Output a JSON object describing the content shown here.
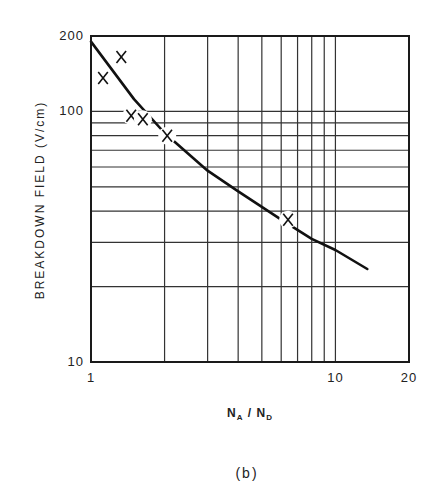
{
  "chart_data": {
    "type": "scatter",
    "title": "",
    "caption": "(b)",
    "xlabel": "N_A / N_D",
    "xlabel_parts": {
      "n1": "N",
      "s1": "A",
      "sep": " / ",
      "n2": "N",
      "s2": "D"
    },
    "ylabel": "BREAKDOWN FIELD (V/cm)",
    "xscale": "log",
    "yscale": "log",
    "xlim": [
      1,
      20
    ],
    "ylim": [
      10,
      200
    ],
    "x_tick_labels": [
      "1",
      "10",
      "20"
    ],
    "x_ticks": [
      1,
      10,
      20
    ],
    "y_tick_labels": [
      "10",
      "100",
      "200"
    ],
    "y_ticks": [
      10,
      100,
      200
    ],
    "grid": true,
    "x_gridlines": [
      2,
      3,
      4,
      5,
      6,
      7,
      8,
      9,
      10
    ],
    "y_gridlines": [
      20,
      30,
      40,
      50,
      60,
      70,
      80,
      90,
      100
    ],
    "series": [
      {
        "name": "measured",
        "marker": "x",
        "x": [
          1.12,
          1.33,
          1.46,
          1.63,
          2.05,
          6.4
        ],
        "y": [
          136,
          165,
          96,
          93,
          80,
          37
        ]
      },
      {
        "name": "fit curve",
        "style": "line",
        "x": [
          1.0,
          1.5,
          2.0,
          3.0,
          4.0,
          6.0,
          8.0,
          10.0,
          13.5
        ],
        "y": [
          190,
          112,
          82,
          58,
          48,
          37,
          31,
          28,
          23.5
        ]
      }
    ],
    "legend": null
  }
}
